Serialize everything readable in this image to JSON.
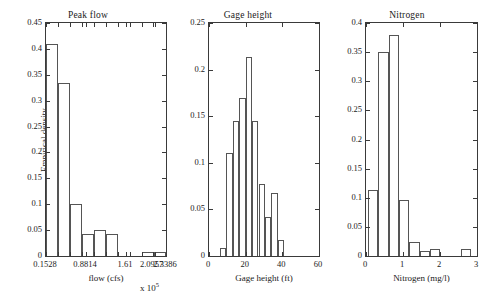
{
  "figure": {
    "background": "#ffffff",
    "bar_edge_color": "#555555",
    "axis_color": "#3a3a3a",
    "shared_ylabel": "Empirical density",
    "exponent_note_prefix": "x 10",
    "exponent_note_power": "5"
  },
  "chart_data": [
    {
      "type": "bar",
      "title": "Peak flow",
      "xlabel": "flow (cfs)",
      "ylabel": "Empirical density",
      "x_exponent": "x 10^5",
      "xlim": [
        0.1528,
        2.3386
      ],
      "ylim": [
        0,
        0.45
      ],
      "xticks": [
        0.1528,
        0.8814,
        1.61,
        2.0957,
        2.3386
      ],
      "xticklabels": [
        "0.1528",
        "0.8814",
        "1.61",
        "2.0957",
        "2.3386"
      ],
      "yticks": [
        0,
        0.05,
        0.1,
        0.15,
        0.2,
        0.25,
        0.3,
        0.35,
        0.4,
        0.45
      ],
      "yticklabels": [
        "0",
        "0.05",
        "0.1",
        "0.15",
        "0.2",
        "0.25",
        "0.3",
        "0.35",
        "0.4",
        "0.45"
      ],
      "grid": false,
      "legend": "none",
      "bin_edges": [
        0.1528,
        0.37,
        0.59,
        0.81,
        1.03,
        1.25,
        1.47,
        1.69,
        1.91,
        2.13,
        2.3386
      ],
      "values": [
        0.41,
        0.335,
        0.101,
        0.042,
        0.051,
        0.042,
        0.0,
        0.0,
        0.008,
        0.008
      ]
    },
    {
      "type": "bar",
      "title": "Gage height",
      "xlabel": "Gage height (ft)",
      "ylabel": "Empirical density",
      "xlim": [
        0,
        60
      ],
      "ylim": [
        0,
        0.25
      ],
      "xticks": [
        0,
        20,
        40,
        60
      ],
      "xticklabels": [
        "0",
        "20",
        "40",
        "60"
      ],
      "yticks": [
        0,
        0.05,
        0.1,
        0.15,
        0.2,
        0.25
      ],
      "yticklabels": [
        "0",
        "0.05",
        "0.1",
        "0.15",
        "0.2",
        "0.25"
      ],
      "grid": false,
      "legend": "none",
      "bin_edges": [
        6,
        9.5,
        13,
        16.5,
        20,
        23.5,
        27,
        30.5,
        34,
        37.5,
        41
      ],
      "values": [
        0.009,
        0.111,
        0.145,
        0.17,
        0.213,
        0.145,
        0.077,
        0.042,
        0.068,
        0.017
      ]
    },
    {
      "type": "bar",
      "title": "Nitrogen",
      "xlabel": "Nitrogen (mg/l)",
      "ylabel": "Empirical density",
      "xlim": [
        0,
        3
      ],
      "ylim": [
        0,
        0.4
      ],
      "xticks": [
        0,
        1,
        2,
        3
      ],
      "xticklabels": [
        "0",
        "1",
        "2",
        "3"
      ],
      "yticks": [
        0,
        0.05,
        0.1,
        0.15,
        0.2,
        0.25,
        0.3,
        0.35,
        0.4
      ],
      "yticklabels": [
        "0",
        "0.05",
        "0.1",
        "0.15",
        "0.2",
        "0.25",
        "0.3",
        "0.35",
        "0.4"
      ],
      "grid": false,
      "legend": "none",
      "bin_edges": [
        0.05,
        0.33,
        0.61,
        0.89,
        1.17,
        1.45,
        1.73,
        2.01,
        2.29,
        2.57,
        2.85
      ],
      "values": [
        0.113,
        0.35,
        0.38,
        0.096,
        0.024,
        0.008,
        0.012,
        0.0,
        0.0,
        0.012
      ]
    }
  ]
}
